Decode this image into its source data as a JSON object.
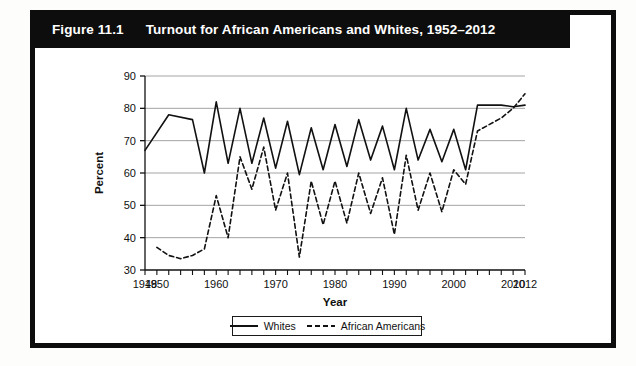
{
  "figure": {
    "number_label": "Figure 11.1",
    "title": "Turnout for African Americans and Whites, 1952–2012"
  },
  "legend": {
    "items": [
      {
        "label": "Whites",
        "style": "solid",
        "color": "#111111"
      },
      {
        "label": "African Americans",
        "style": "dashed",
        "color": "#111111"
      }
    ]
  },
  "chart_data": {
    "type": "line",
    "title": "Turnout for African Americans and Whites, 1952–2012",
    "xlabel": "Year",
    "ylabel": "Percent",
    "xlim": [
      1948,
      2012
    ],
    "ylim": [
      30,
      90
    ],
    "ytick_step": 10,
    "yticks": [
      30,
      40,
      50,
      60,
      70,
      80,
      90
    ],
    "ytick_labels": [
      "30",
      "40",
      "50",
      "60",
      "70",
      "80",
      "90"
    ],
    "xticks": [
      1948,
      1950,
      1952,
      1954,
      1956,
      1958,
      1960,
      1962,
      1964,
      1966,
      1968,
      1970,
      1972,
      1974,
      1976,
      1978,
      1980,
      1982,
      1984,
      1986,
      1988,
      1990,
      1992,
      1994,
      1996,
      1998,
      2000,
      2002,
      2004,
      2006,
      2008,
      2010,
      2012
    ],
    "xtick_labels_shown": [
      {
        "value": 1948,
        "label": "1948"
      },
      {
        "value": 1950,
        "label": "1950"
      },
      {
        "value": 1960,
        "label": "1960"
      },
      {
        "value": 1970,
        "label": "1970"
      },
      {
        "value": 1980,
        "label": "1980"
      },
      {
        "value": 1990,
        "label": "1990"
      },
      {
        "value": 2000,
        "label": "2000"
      },
      {
        "value": 2010,
        "label": "2010"
      },
      {
        "value": 2012,
        "label": "2012"
      }
    ],
    "grid": {
      "horizontal": true,
      "vertical": false,
      "color": "#9a9a9a"
    },
    "legend_position": "below-center",
    "x": [
      1948,
      1950,
      1952,
      1954,
      1956,
      1958,
      1960,
      1962,
      1964,
      1966,
      1968,
      1970,
      1972,
      1974,
      1976,
      1978,
      1980,
      1982,
      1984,
      1986,
      1988,
      1990,
      1992,
      1994,
      1996,
      1998,
      2000,
      2002,
      2004,
      2006,
      2008,
      2010,
      2012
    ],
    "series": [
      {
        "name": "Whites",
        "style": "solid",
        "color": "#111111",
        "x": [
          1948,
          1952,
          1956,
          1958,
          1960,
          1962,
          1964,
          1966,
          1968,
          1970,
          1972,
          1974,
          1976,
          1978,
          1980,
          1982,
          1984,
          1986,
          1988,
          1990,
          1992,
          1994,
          1996,
          1998,
          2000,
          2002,
          2004,
          2008,
          2010,
          2012
        ],
        "values": [
          67,
          78,
          76.5,
          60,
          82,
          63,
          80,
          63,
          77,
          61.5,
          76,
          59.5,
          74,
          61,
          75,
          62,
          76.5,
          64,
          74.5,
          61,
          80,
          64,
          73.5,
          63.5,
          73.5,
          61,
          81,
          81,
          80.5,
          81
        ]
      },
      {
        "name": "African Americans",
        "style": "dashed",
        "color": "#111111",
        "x": [
          1950,
          1952,
          1954,
          1956,
          1958,
          1960,
          1962,
          1964,
          1966,
          1968,
          1970,
          1972,
          1974,
          1976,
          1978,
          1980,
          1982,
          1984,
          1986,
          1988,
          1990,
          1992,
          1994,
          1996,
          1998,
          2000,
          2002,
          2004,
          2008,
          2010,
          2012
        ],
        "values": [
          37,
          34.5,
          33.5,
          34.5,
          36.5,
          53,
          40,
          65,
          55,
          68,
          48.5,
          60,
          34,
          57.5,
          44,
          57.5,
          44.5,
          60,
          47.5,
          58.5,
          41,
          65.5,
          48.5,
          60,
          48,
          61,
          56.5,
          73,
          77,
          80,
          84.5
        ]
      }
    ]
  }
}
